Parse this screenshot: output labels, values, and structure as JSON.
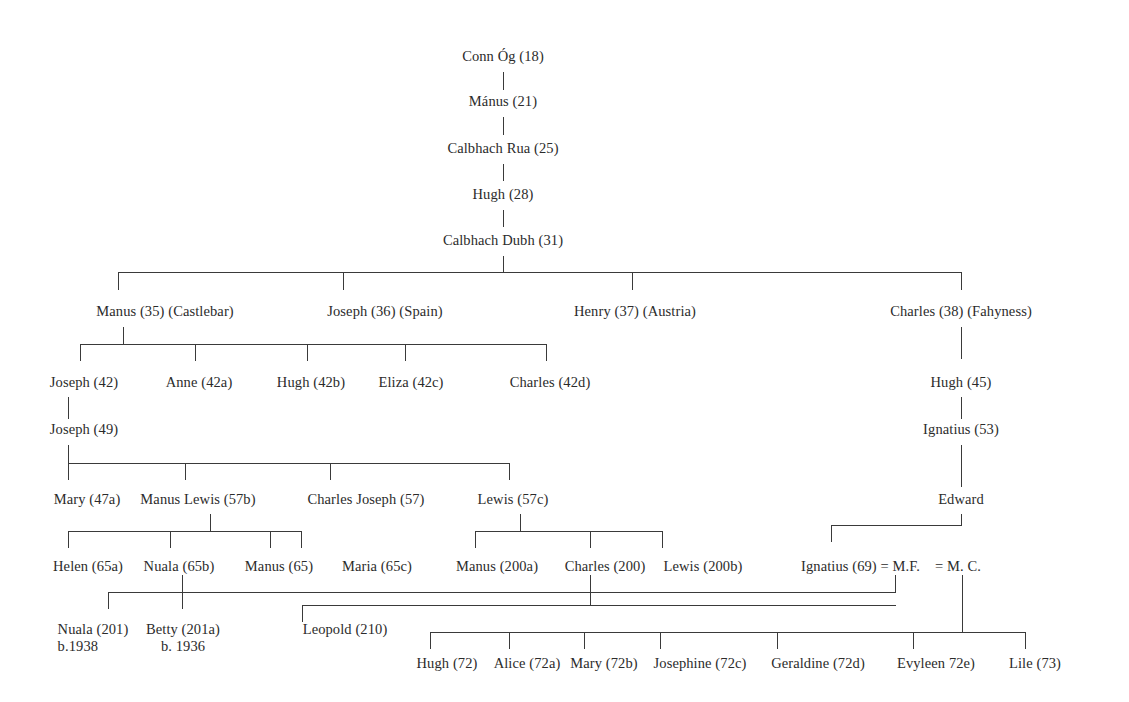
{
  "diagram": {
    "type": "genealogical-tree",
    "background": "#ffffff",
    "line_color": "#3a3a3a",
    "text_color": "#2b2b2b"
  },
  "generations": {
    "g1": {
      "label": "Conn Óg (18)"
    },
    "g2": {
      "label": "Mánus (21)"
    },
    "g3": {
      "label": "Calbhach Rua (25)"
    },
    "g4": {
      "label": "Hugh (28)"
    },
    "g5": {
      "label": "Calbhach Dubh (31)"
    }
  },
  "row_children_of_calbhach_dubh": [
    {
      "label": "Manus (35) (Castlebar)"
    },
    {
      "label": "Joseph (36) (Spain)"
    },
    {
      "label": "Henry (37) (Austria)"
    },
    {
      "label": "Charles (38) (Fahyness)"
    }
  ],
  "row_children_of_manus35": [
    {
      "label": "Joseph (42)"
    },
    {
      "label": "Anne (42a)"
    },
    {
      "label": "Hugh (42b)"
    },
    {
      "label": "Eliza (42c)"
    },
    {
      "label": "Charles (42d)"
    }
  ],
  "row_joseph49": {
    "label": "Joseph (49)"
  },
  "row_children_of_joseph49": [
    {
      "label": "Mary (47a)"
    },
    {
      "label": "Manus Lewis (57b)"
    },
    {
      "label": "Charles Joseph (57)"
    },
    {
      "label": "Lewis (57c)"
    }
  ],
  "charles38_line": [
    {
      "label": "Hugh (45)"
    },
    {
      "label": "Ignatius (53)"
    },
    {
      "label": "Edward"
    }
  ],
  "row_children_of_charles_joseph57": [
    {
      "label": "Helen (65a)"
    },
    {
      "label": "Nuala (65b)"
    },
    {
      "label": "Manus (65)"
    },
    {
      "label": "Maria (65c)"
    }
  ],
  "row_children_of_lewis57c": [
    {
      "label": "Manus (200a)"
    },
    {
      "label": "Charles (200)"
    },
    {
      "label": "Lewis (200b)"
    }
  ],
  "edward_marriages": {
    "spouse_one_line": "Ignatius (69) = M.F.",
    "spouse_two_line": "=  M. C."
  },
  "row_children_of_nuala65b": [
    {
      "label": "Nuala (201)",
      "sub": "b.1938"
    },
    {
      "label": "Betty (201a)",
      "sub": "b. 1936"
    }
  ],
  "row_child_of_charles200": [
    {
      "label": "Leopold (210)"
    }
  ],
  "row_children_of_mc": [
    {
      "label": "Hugh (72)"
    },
    {
      "label": "Alice (72a)"
    },
    {
      "label": "Mary (72b)"
    },
    {
      "label": "Josephine (72c)"
    },
    {
      "label": "Geraldine (72d)"
    },
    {
      "label": "Evyleen 72e)"
    },
    {
      "label": "Lile (73)"
    }
  ]
}
